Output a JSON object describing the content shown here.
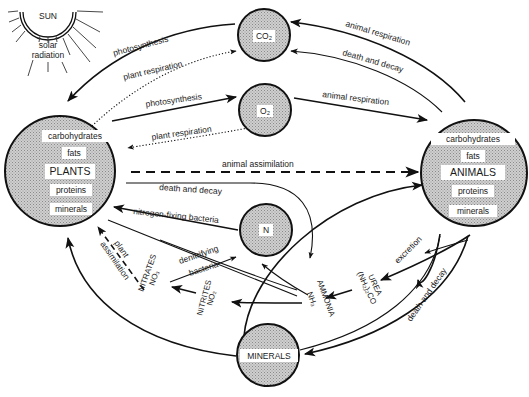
{
  "sun": {
    "label": "SUN",
    "radiation_line1": "solar",
    "radiation_line2": "radiation"
  },
  "nodes": {
    "plants": {
      "title": "PLANTS",
      "items": [
        "carbohydrates",
        "fats",
        "proteins",
        "minerals"
      ]
    },
    "animals": {
      "title": "ANIMALS",
      "items": [
        "carbohydrates",
        "fats",
        "proteins",
        "minerals"
      ]
    },
    "co2": {
      "label": "CO₂"
    },
    "o2": {
      "label": "O₂"
    },
    "n": {
      "label": "N"
    },
    "minerals": {
      "label": "MINERALS"
    }
  },
  "compounds": {
    "nitrates": {
      "name": "NITRATES",
      "formula": "NO₃"
    },
    "nitrites": {
      "name": "NITRITES",
      "formula": "NO₂"
    },
    "ammonia": {
      "name": "AMMONIA",
      "formula": "NH₃"
    },
    "urea": {
      "name": "UREA",
      "formula": "(NH₂)₂CO"
    }
  },
  "flows": {
    "photosynthesis_sun": "photosynthesis",
    "plant_respiration_co2": "plant respiration",
    "photosynthesis_o2": "photosynthesis",
    "plant_respiration_o2": "plant respiration",
    "animal_respiration_co2": "animal respiration",
    "death_decay_co2": "death and decay",
    "animal_respiration_o2": "animal respiration",
    "animal_assimilation": "animal assimilation",
    "death_decay_plants": "death and decay",
    "nitrogen_fixing": "nitrogen-fixing bacteria",
    "denitrifying_line1": "denitrifying",
    "denitrifying_line2": "bacteria",
    "plant_assimilation_line1": "plant",
    "plant_assimilation_line2": "assimilation",
    "excretion": "excretion",
    "death_decay_animals": "death and decay"
  }
}
